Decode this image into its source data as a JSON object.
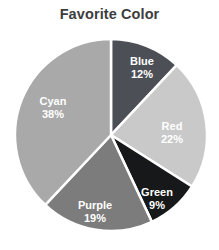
{
  "chart_data": {
    "type": "pie",
    "title": "Favorite Color",
    "xlabel": "",
    "ylabel": "",
    "categories": [
      "Blue",
      "Red",
      "Green",
      "Purple",
      "Cyan"
    ],
    "values": [
      12,
      22,
      9,
      19,
      38
    ],
    "value_unit": "%",
    "labels": [
      {
        "name": "Blue",
        "percent": "12%",
        "value": 12,
        "color": "#4c4f56"
      },
      {
        "name": "Red",
        "percent": "22%",
        "value": 22,
        "color": "#c9c9c9"
      },
      {
        "name": "Green",
        "percent": "9%",
        "value": 9,
        "color": "#17181a"
      },
      {
        "name": "Purple",
        "percent": "19%",
        "value": 19,
        "color": "#7c7c7c"
      },
      {
        "name": "Cyan",
        "percent": "38%",
        "value": 38,
        "color": "#a9a9a9"
      }
    ],
    "start_angle_deg": 0,
    "direction": "clockwise",
    "legend": "none",
    "labels_inside": true,
    "grid": false,
    "separator_color": "#ffffff",
    "background_color": "#ffffff",
    "title_color": "#3d3d3d",
    "label_text_color": "#ffffff"
  },
  "geometry": {
    "center_x": 111,
    "center_y": 135,
    "radius": 96,
    "label_positions": [
      {
        "x": 142,
        "y": 67
      },
      {
        "x": 172,
        "y": 132
      },
      {
        "x": 157,
        "y": 198
      },
      {
        "x": 95,
        "y": 211
      },
      {
        "x": 53,
        "y": 107
      }
    ]
  }
}
